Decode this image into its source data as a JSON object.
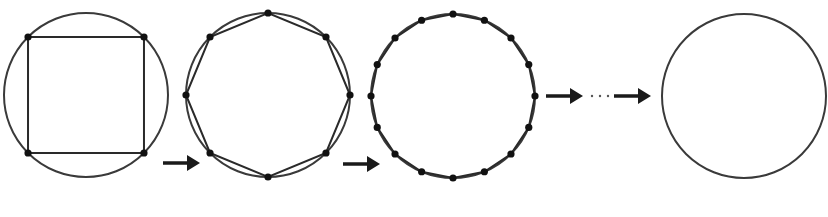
{
  "diagram": {
    "colors": {
      "stroke": "#3a3a3a",
      "vertex": "#111111",
      "arrow": "#1a1a1a",
      "background": "#ffffff"
    },
    "stages": [
      {
        "id": "stage-1",
        "shape": "square",
        "sides": 4,
        "center": [
          86,
          95
        ],
        "radius": 82,
        "vertex_start_angle_deg": 45,
        "show_polygon": true
      },
      {
        "id": "stage-2",
        "shape": "octagon",
        "sides": 8,
        "center": [
          268,
          95
        ],
        "radius": 82,
        "vertex_start_angle_deg": 0,
        "show_polygon": true
      },
      {
        "id": "stage-3",
        "shape": "hexadecagon",
        "sides": 16,
        "center": [
          453,
          96
        ],
        "radius": 82,
        "vertex_start_angle_deg": 0,
        "show_polygon": true
      },
      {
        "id": "stage-4",
        "shape": "circle",
        "sides": null,
        "center": [
          744,
          96
        ],
        "radius": 82,
        "show_polygon": false
      }
    ],
    "arrows": [
      {
        "id": "arrow-1",
        "from": [
          163,
          163
        ],
        "to": [
          200,
          163
        ]
      },
      {
        "id": "arrow-2",
        "from": [
          343,
          164
        ],
        "to": [
          380,
          164
        ]
      },
      {
        "id": "arrow-3",
        "from": [
          546,
          96
        ],
        "to": [
          583,
          96
        ]
      },
      {
        "id": "arrow-4",
        "from": [
          614,
          96
        ],
        "to": [
          651,
          96
        ]
      }
    ],
    "ellipsis": {
      "text": "···",
      "points": [
        [
          592,
          96
        ],
        [
          600,
          96
        ],
        [
          608,
          96
        ]
      ]
    }
  }
}
